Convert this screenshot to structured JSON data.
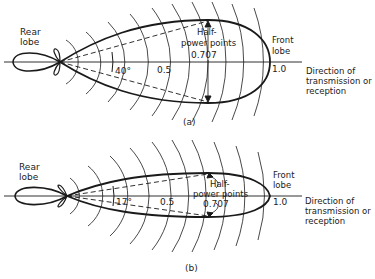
{
  "diagrams": [
    {
      "id": "a",
      "caption": "(a)",
      "rear_lobe_label": [
        "Rear",
        "lobe"
      ],
      "front_lobe_label": [
        "Front",
        "lobe"
      ],
      "half_power_label": [
        "Half-",
        "power points"
      ],
      "half_power_value": "0.707",
      "mid_value": "0.5",
      "tip_value": "1.0",
      "beamwidth": "40°",
      "direction_label": [
        "Direction of",
        "transmission or",
        "reception"
      ]
    },
    {
      "id": "b",
      "caption": "(b)",
      "rear_lobe_label": [
        "Rear",
        "lobe"
      ],
      "front_lobe_label": [
        "Front",
        "lobe"
      ],
      "half_power_label": [
        "Half-",
        "power points"
      ],
      "half_power_value": "0.707",
      "mid_value": "0.5",
      "tip_value": "1.0",
      "beamwidth": "17°",
      "direction_label": [
        "Direction of",
        "transmission or",
        "reception"
      ]
    }
  ],
  "colors": {
    "line": "#1a1a1a",
    "background": "#ffffff"
  }
}
